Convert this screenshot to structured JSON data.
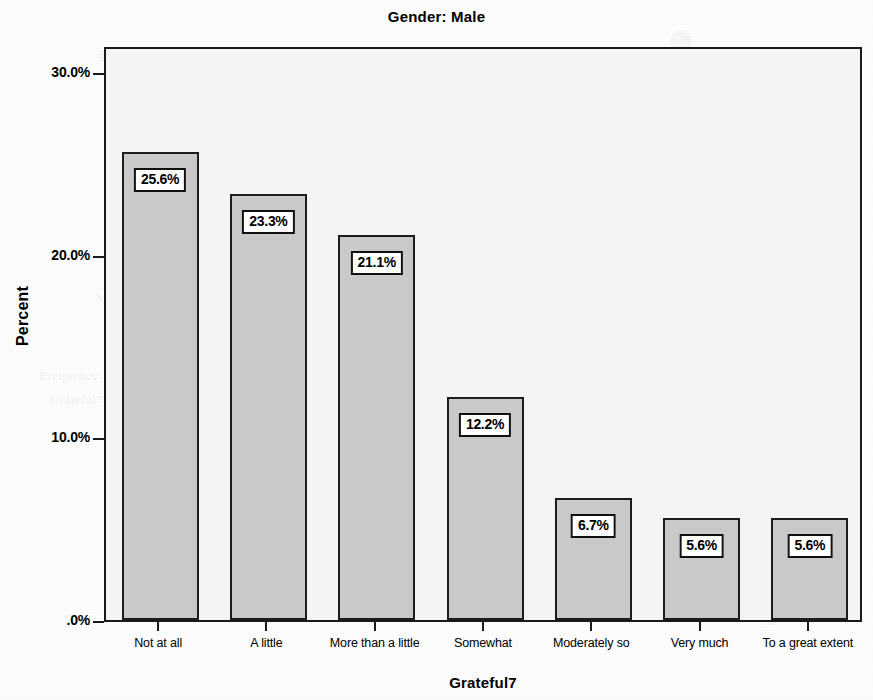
{
  "chart_data": {
    "type": "bar",
    "title": "Gender: Male",
    "xlabel": "Grateful7",
    "ylabel": "Percent",
    "categories": [
      "Not at all",
      "A little",
      "More than a little",
      "Somewhat",
      "Moderately so",
      "Very much",
      "To a great extent"
    ],
    "values": [
      25.6,
      23.3,
      21.1,
      12.2,
      6.7,
      5.6,
      5.6
    ],
    "value_labels": [
      "25.6%",
      "23.3%",
      "21.1%",
      "12.2%",
      "6.7%",
      "5.6%",
      "5.6%"
    ],
    "ylim": [
      0,
      32
    ],
    "y_ticks": [
      0,
      10,
      20,
      30
    ],
    "y_tick_labels": [
      ".0%",
      "10.0%",
      "20.0%",
      "30.0%"
    ],
    "grid": false,
    "legend": "none",
    "colors": {
      "bar_fill": "#c9c9c9",
      "bar_border": "#1c1c1c",
      "plot_background": "#f4f4f4",
      "axis": "#1a1a1a",
      "label_box_background": "#ffffff",
      "label_box_border": "#111111",
      "text": "#000000"
    }
  },
  "scan_artifacts": {
    "ghost_lines": [
      {
        "text": "Gender",
        "x": 690,
        "y": 78
      },
      {
        "text": "Statistics",
        "x": 700,
        "y": 96
      },
      {
        "text": "Valid",
        "x": 120,
        "y": 262
      },
      {
        "text": "Missing",
        "x": 96,
        "y": 290
      },
      {
        "text": "Frequency Table",
        "x": 40,
        "y": 368
      },
      {
        "text": "Grateful7",
        "x": 50,
        "y": 392
      }
    ]
  }
}
